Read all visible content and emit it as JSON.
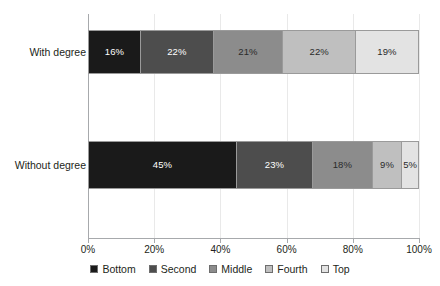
{
  "chart_data": {
    "type": "bar",
    "orientation": "horizontal",
    "stacked": true,
    "stack_mode": "percent",
    "title": "",
    "subtitle": "",
    "xlabel": "",
    "ylabel": "",
    "xlim": [
      0,
      100
    ],
    "xticks": [
      0,
      20,
      40,
      60,
      80,
      100
    ],
    "xtick_labels": [
      "0%",
      "20%",
      "40%",
      "60%",
      "80%",
      "100%"
    ],
    "grid": "vertical",
    "legend_position": "bottom",
    "categories": [
      "With degree",
      "Without degree"
    ],
    "series": [
      {
        "name": "Bottom",
        "color": "#1a1a1a",
        "label_color": "light",
        "values": [
          16,
          22
        ],
        "value_labels": [
          "16%",
          "45%"
        ]
      },
      {
        "name": "Second",
        "color": "#4d4d4d",
        "label_color": "light",
        "values": [
          22,
          23
        ],
        "value_labels": [
          "22%",
          "23%"
        ]
      },
      {
        "name": "Middle",
        "color": "#8c8c8c",
        "label_color": "dark",
        "values": [
          21,
          18
        ],
        "value_labels": [
          "21%",
          "18%"
        ]
      },
      {
        "name": "Fourth",
        "color": "#bfbfbf",
        "label_color": "dark",
        "values": [
          22,
          9
        ],
        "value_labels": [
          "22%",
          "9%"
        ]
      },
      {
        "name": "Top",
        "color": "#e3e3e3",
        "label_color": "dark",
        "values": [
          19,
          5
        ],
        "value_labels": [
          "19%",
          "5%"
        ]
      }
    ],
    "bars": [
      {
        "category": "With degree",
        "segments": [
          {
            "series": "Bottom",
            "value": 16,
            "label": "16%",
            "color": "#1a1a1a",
            "label_color": "light"
          },
          {
            "series": "Second",
            "value": 22,
            "label": "22%",
            "color": "#4d4d4d",
            "label_color": "light"
          },
          {
            "series": "Middle",
            "value": 21,
            "label": "21%",
            "color": "#8c8c8c",
            "label_color": "dark"
          },
          {
            "series": "Fourth",
            "value": 22,
            "label": "22%",
            "color": "#bfbfbf",
            "label_color": "dark"
          },
          {
            "series": "Top",
            "value": 19,
            "label": "19%",
            "color": "#e3e3e3",
            "label_color": "dark"
          }
        ]
      },
      {
        "category": "Without degree",
        "segments": [
          {
            "series": "Bottom",
            "value": 45,
            "label": "45%",
            "color": "#1a1a1a",
            "label_color": "light"
          },
          {
            "series": "Second",
            "value": 23,
            "label": "23%",
            "color": "#4d4d4d",
            "label_color": "light"
          },
          {
            "series": "Middle",
            "value": 18,
            "label": "18%",
            "color": "#8c8c8c",
            "label_color": "dark"
          },
          {
            "series": "Fourth",
            "value": 9,
            "label": "9%",
            "color": "#bfbfbf",
            "label_color": "dark"
          },
          {
            "series": "Top",
            "value": 5,
            "label": "5%",
            "color": "#e3e3e3",
            "label_color": "dark"
          }
        ]
      }
    ],
    "legend": [
      {
        "label": "Bottom",
        "color": "#1a1a1a"
      },
      {
        "label": "Second",
        "color": "#4d4d4d"
      },
      {
        "label": "Middle",
        "color": "#8c8c8c"
      },
      {
        "label": "Fourth",
        "color": "#bfbfbf"
      },
      {
        "label": "Top",
        "color": "#e3e3e3"
      }
    ],
    "axis_color": "#a7a9ac",
    "grid_color": "#e9e9e9",
    "segment_border_color": "#9a9a9a",
    "background": "#ffffff"
  }
}
